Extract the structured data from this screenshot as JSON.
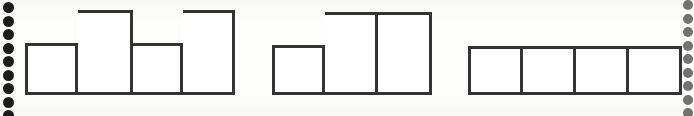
{
  "page": {
    "width": 694,
    "height": 116,
    "background_color": "#fdfdfc",
    "ink_color": "#2b2b2b"
  },
  "binding": {
    "left": {
      "label": "left-binding-holes",
      "hole_color": "#1c1c1c",
      "count": 9,
      "x": 8,
      "diameter": 11,
      "spacing": 13.5,
      "first_y": 2
    },
    "right": {
      "label": "right-binding-holes",
      "hole_color": "#4a4a4a",
      "count": 9,
      "x": 688,
      "diameter": 10,
      "spacing": 13.5,
      "first_y": 0
    }
  },
  "chart_data": {
    "type": "bar",
    "title": "",
    "subtitle": "",
    "xlabel": "",
    "ylabel": "",
    "grid": false,
    "legend": null,
    "axis_visible": false,
    "baseline_y": 95,
    "unit_short": 52,
    "unit_tall": 85,
    "charts": [
      {
        "name": "bar-group-1",
        "left": 25,
        "baseline": 95,
        "categories": [
          "1",
          "2",
          "3",
          "4"
        ],
        "values": [
          52,
          85,
          52,
          85
        ],
        "bar_widths": [
          53,
          55,
          50,
          52
        ],
        "bar_lefts": [
          0,
          53,
          108,
          158
        ],
        "total_width": 210
      },
      {
        "name": "bar-group-2",
        "left": 272,
        "baseline": 95,
        "categories": [
          "1",
          "2",
          "3"
        ],
        "values": [
          50,
          83,
          83
        ],
        "bar_widths": [
          53,
          53,
          54
        ],
        "bar_lefts": [
          0,
          53,
          106
        ],
        "total_width": 160
      },
      {
        "name": "bar-group-3",
        "left": 468,
        "baseline": 95,
        "categories": [
          "1",
          "2",
          "3",
          "4"
        ],
        "values": [
          49,
          49,
          49,
          49
        ],
        "bar_widths": [
          55,
          53,
          53,
          53
        ],
        "bar_lefts": [
          0,
          55,
          108,
          161
        ],
        "total_width": 214
      }
    ]
  }
}
